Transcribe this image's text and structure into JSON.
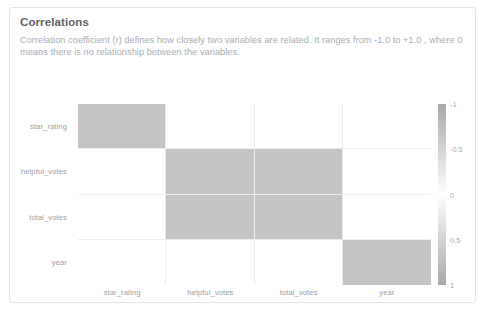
{
  "card": {
    "title": "Correlations",
    "description": "Correlation coefficient (r) defines how closely two variables are related. It ranges from -1.0 to +1.0 , where 0 means there is no relationship between the variables."
  },
  "chart_data": {
    "type": "heatmap",
    "title": "Correlations",
    "xlabel": "",
    "ylabel": "",
    "grid": true,
    "legend_position": "right",
    "categories": [
      "star_rating",
      "helpful_votes",
      "total_votes",
      "year"
    ],
    "x": [
      "star_rating",
      "helpful_votes",
      "total_votes",
      "year"
    ],
    "y": [
      "star_rating",
      "helpful_votes",
      "total_votes",
      "year"
    ],
    "colorbar": {
      "min": -1,
      "max": 1,
      "ticks": [
        "-1",
        "-0.5",
        "0",
        "0.5",
        "1"
      ],
      "tick_values": [
        -1,
        -0.5,
        0,
        0.5,
        1
      ],
      "low_color": "#a8a8a8",
      "mid_color": "#ffffff",
      "high_color": "#a8a8a8"
    },
    "values": [
      [
        1.0,
        0.0,
        0.0,
        0.0
      ],
      [
        0.0,
        1.0,
        1.0,
        0.0
      ],
      [
        0.0,
        1.0,
        1.0,
        0.0
      ],
      [
        0.0,
        0.0,
        0.0,
        1.0
      ]
    ],
    "cell_fill": [
      [
        "#c4c4c4",
        "#ffffff",
        "#ffffff",
        "#ffffff"
      ],
      [
        "#ffffff",
        "#c4c4c4",
        "#c4c4c4",
        "#ffffff"
      ],
      [
        "#ffffff",
        "#c4c4c4",
        "#c4c4c4",
        "#ffffff"
      ],
      [
        "#ffffff",
        "#ffffff",
        "#ffffff",
        "#c4c4c4"
      ]
    ]
  }
}
